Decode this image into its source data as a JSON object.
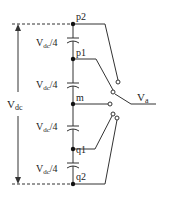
{
  "diagram": {
    "nodes": [
      {
        "id": "p2",
        "label": "p2"
      },
      {
        "id": "p1",
        "label": "p1"
      },
      {
        "id": "m",
        "label": "m"
      },
      {
        "id": "q1",
        "label": "q1"
      },
      {
        "id": "q2",
        "label": "q2"
      }
    ],
    "capacitors": [
      {
        "label_main": "V",
        "label_sub": "dc",
        "label_tail": "/4"
      },
      {
        "label_main": "V",
        "label_sub": "dc",
        "label_tail": "/4"
      },
      {
        "label_main": "V",
        "label_sub": "dc",
        "label_tail": "/4"
      },
      {
        "label_main": "V",
        "label_sub": "dc",
        "label_tail": "/4"
      }
    ],
    "dc_voltage": {
      "main": "V",
      "sub": "dc"
    },
    "output": {
      "main": "V",
      "sub": "a"
    },
    "colors": {
      "line": "#333333",
      "text": "#222222"
    }
  }
}
